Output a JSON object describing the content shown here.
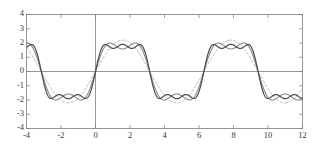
{
  "figure": {
    "background_color": "#ffffff",
    "frame_color": "#7d7d7d",
    "axis_color": "#7d7d7d"
  },
  "chart_data": {
    "type": "line",
    "title": "",
    "subtitle": "",
    "xlabel": "",
    "ylabel": "",
    "xlim": [
      -4,
      12
    ],
    "ylim": [
      -4,
      4
    ],
    "grid": false,
    "legend_position": "none",
    "annotations": [],
    "xticks": [
      -4,
      -2,
      0,
      2,
      4,
      6,
      8,
      10,
      12
    ],
    "xtick_labels": [
      "-4",
      "-2",
      "0",
      "2",
      "4",
      "6",
      "8",
      "10",
      "12"
    ],
    "yticks": [
      -4,
      -3,
      -2,
      -1,
      0,
      1,
      2,
      3,
      4
    ],
    "ytick_labels": [
      "4",
      "3",
      "2",
      "1",
      "0",
      "-1",
      "-2",
      "-3",
      "-4"
    ],
    "series": [
      {
        "name": "fundamental-harmonic",
        "style": "dashed",
        "color": "#b4b4b4",
        "stroke_width": 1.0,
        "amplitude": 2.2,
        "harmonics": [
          {
            "n": 1,
            "coefficient": 2.2
          }
        ],
        "peak_value": 2.2,
        "trough_value": -2.2,
        "period": 6.283
      },
      {
        "name": "two-term-partial-sum",
        "style": "solid",
        "color": "#8a8a8a",
        "stroke_width": 1.1,
        "amplitude": 2.7,
        "harmonics": [
          {
            "n": 1,
            "coefficient": 2.2
          },
          {
            "n": 3,
            "coefficient": 0.62
          }
        ],
        "peak_value": 2.72,
        "trough_value": -2.72,
        "period": 6.283
      },
      {
        "name": "three-term-partial-sum",
        "style": "solid",
        "color": "#4a4a4a",
        "stroke_width": 1.2,
        "amplitude": 2.9,
        "harmonics": [
          {
            "n": 1,
            "coefficient": 2.2
          },
          {
            "n": 3,
            "coefficient": 0.62
          },
          {
            "n": 5,
            "coefficient": 0.33
          }
        ],
        "peak_value": 2.93,
        "trough_value": -2.93,
        "period": 6.283
      }
    ],
    "zero_crossings": [
      -3.14,
      0,
      3.14,
      6.28,
      9.42
    ],
    "key_points": [
      {
        "x": -4,
        "y": 3.0,
        "series": "three-term-partial-sum"
      },
      {
        "x": -2.4,
        "y": -2.9,
        "series": "three-term-partial-sum"
      },
      {
        "x": 2.3,
        "y": 2.93,
        "series": "three-term-partial-sum"
      },
      {
        "x": 3.9,
        "y": -2.9,
        "series": "three-term-partial-sum"
      },
      {
        "x": 8.6,
        "y": 2.93,
        "series": "three-term-partial-sum"
      },
      {
        "x": 10.2,
        "y": -2.8,
        "series": "three-term-partial-sum"
      }
    ]
  }
}
